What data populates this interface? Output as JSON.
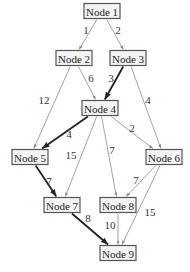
{
  "diagram": {
    "nodes": [
      {
        "id": "1",
        "label": "Node 1"
      },
      {
        "id": "2",
        "label": "Node 2"
      },
      {
        "id": "3",
        "label": "Node 3"
      },
      {
        "id": "4",
        "label": "Node 4"
      },
      {
        "id": "5",
        "label": "Node 5"
      },
      {
        "id": "6",
        "label": "Node 6"
      },
      {
        "id": "7",
        "label": "Node 7"
      },
      {
        "id": "8",
        "label": "Node 8"
      },
      {
        "id": "9",
        "label": "Node 9"
      }
    ],
    "edges": [
      {
        "from": "1",
        "to": "2",
        "weight": "1",
        "highlighted": false
      },
      {
        "from": "1",
        "to": "3",
        "weight": "2",
        "highlighted": false
      },
      {
        "from": "2",
        "to": "4",
        "weight": "6",
        "highlighted": false
      },
      {
        "from": "2",
        "to": "5",
        "weight": "12",
        "highlighted": false
      },
      {
        "from": "3",
        "to": "4",
        "weight": "3",
        "highlighted": true
      },
      {
        "from": "3",
        "to": "6",
        "weight": "4",
        "highlighted": false
      },
      {
        "from": "4",
        "to": "5",
        "weight": "4",
        "highlighted": true
      },
      {
        "from": "4",
        "to": "6",
        "weight": "2",
        "highlighted": false
      },
      {
        "from": "4",
        "to": "7",
        "weight": "15",
        "highlighted": false
      },
      {
        "from": "4",
        "to": "8",
        "weight": "7",
        "highlighted": false
      },
      {
        "from": "5",
        "to": "7",
        "weight": "7",
        "highlighted": true
      },
      {
        "from": "6",
        "to": "8",
        "weight": "7",
        "highlighted": false
      },
      {
        "from": "6",
        "to": "9",
        "weight": "15",
        "highlighted": false
      },
      {
        "from": "7",
        "to": "9",
        "weight": "8",
        "highlighted": true
      },
      {
        "from": "8",
        "to": "9",
        "weight": "10",
        "highlighted": false
      }
    ]
  }
}
